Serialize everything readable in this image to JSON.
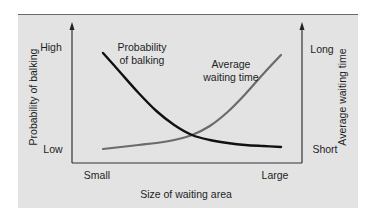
{
  "chart_data": {
    "type": "line",
    "title": "",
    "xlabel": "Size of waiting area",
    "ylabel_left": "Probability of balking",
    "ylabel_right": "Average waiting time",
    "x_ticks": [
      "Small",
      "Large"
    ],
    "y_left_ticks": [
      "Low",
      "High"
    ],
    "y_right_ticks": [
      "Short",
      "Long"
    ],
    "grid": false,
    "legend": "inline annotations",
    "x_range": [
      0,
      1
    ],
    "y_range": [
      0,
      1
    ],
    "x": [
      0.0,
      0.1,
      0.2,
      0.3,
      0.4,
      0.5,
      0.6,
      0.7,
      0.8,
      0.9,
      1.0
    ],
    "series": [
      {
        "name": "Probability of balking",
        "axis": "left",
        "color": "#111111",
        "annotation": [
          "Probability",
          "of balking"
        ],
        "values": [
          0.96,
          0.76,
          0.56,
          0.38,
          0.24,
          0.14,
          0.09,
          0.06,
          0.04,
          0.03,
          0.02
        ]
      },
      {
        "name": "Average waiting time",
        "axis": "right",
        "color": "#6b6b6b",
        "annotation": [
          "Average",
          "waiting time"
        ],
        "values": [
          0.0,
          0.02,
          0.04,
          0.06,
          0.09,
          0.14,
          0.23,
          0.37,
          0.55,
          0.75,
          0.94
        ]
      }
    ],
    "crossing_point": {
      "x": 0.53,
      "y": 0.13
    }
  },
  "axes": {
    "x_label": "Size of waiting area",
    "x_tick_small": "Small",
    "x_tick_large": "Large",
    "left_label": "Probability of balking",
    "left_high": "High",
    "left_low": "Low",
    "right_label": "Average waiting time",
    "right_long": "Long",
    "right_short": "Short"
  },
  "annotations": {
    "balking_line1": "Probability",
    "balking_line2": "of balking",
    "waiting_line1": "Average",
    "waiting_line2": "waiting time"
  },
  "colors": {
    "panel_bg": "#e3e3e3",
    "axis": "#333333",
    "balking_curve": "#111111",
    "waiting_curve": "#6b6b6b",
    "text": "#1e1e1e"
  }
}
